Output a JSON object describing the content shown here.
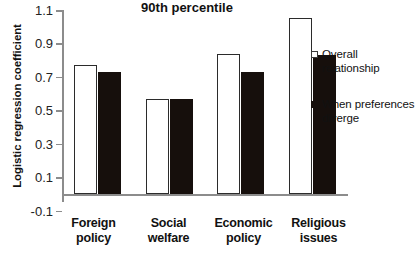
{
  "chart_data": {
    "type": "bar",
    "title": "90th percentile",
    "xlabel": "",
    "ylabel": "Logistic regression coefficient",
    "ylim": [
      -0.1,
      1.1
    ],
    "yticks": [
      "1.1",
      "0.9",
      "0.7",
      "0.5",
      "0.3",
      "0.1",
      "-0.1"
    ],
    "ytick_values": [
      1.1,
      0.9,
      0.7,
      0.5,
      0.3,
      0.1,
      -0.1
    ],
    "grid": false,
    "legend_position": "right",
    "categories": [
      "Foreign policy",
      "Social welfare",
      "Economic policy",
      "Religious issues"
    ],
    "category_lines": [
      [
        "Foreign",
        "policy"
      ],
      [
        "Social",
        "welfare"
      ],
      [
        "Economic",
        "policy"
      ],
      [
        "Religious",
        "issues"
      ]
    ],
    "series": [
      {
        "name": "Overall relationship",
        "style": "open",
        "color": "#ffffff",
        "border_color": "#2b2b2b",
        "values": [
          0.77,
          0.57,
          0.84,
          1.05
        ]
      },
      {
        "name": "When preferences diverge",
        "style": "filled",
        "color": "#160f0c",
        "border_color": "#160f0c",
        "values": [
          0.73,
          0.57,
          0.73,
          0.83
        ]
      }
    ]
  },
  "legend": {
    "items": [
      {
        "label_line1": "Overall",
        "label_line2": "relationship",
        "style": "open"
      },
      {
        "label_line1": "When preferences",
        "label_line2": "diverge",
        "style": "filled"
      }
    ]
  }
}
